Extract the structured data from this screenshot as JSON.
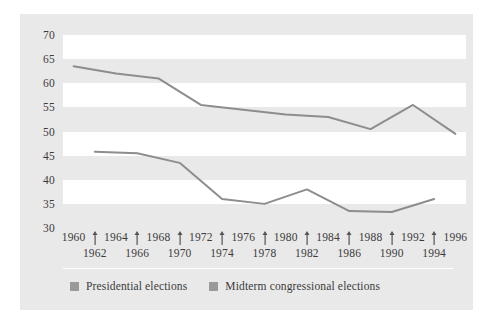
{
  "chart_data": {
    "type": "line",
    "title": "",
    "subtitle": "",
    "xlabel": "",
    "ylabel": "",
    "ylim": [
      30,
      70
    ],
    "ytick_step": 5,
    "ytick_labels": [
      "70",
      "65",
      "60",
      "55",
      "50",
      "45",
      "40",
      "35",
      "30"
    ],
    "grid": "horizontal-bands",
    "legend_position": "bottom-left",
    "xlim": [
      1959,
      1997
    ],
    "line_color": "#8d8d8d",
    "band_color": "#ffffff",
    "panel_color": "#e9e9e9",
    "series": [
      {
        "name": "Presidential elections",
        "x": [
          1960,
          1964,
          1968,
          1972,
          1976,
          1980,
          1984,
          1988,
          1992,
          1996
        ],
        "xlabels": [
          "1960",
          "1964",
          "1968",
          "1972",
          "1976",
          "1980",
          "1984",
          "1988",
          "1992",
          "1996"
        ],
        "values": [
          63.5,
          62.0,
          61.0,
          55.5,
          54.5,
          53.5,
          53.0,
          50.5,
          55.5,
          49.5
        ]
      },
      {
        "name": "Midterm congressional elections",
        "x": [
          1962,
          1966,
          1970,
          1974,
          1978,
          1982,
          1986,
          1990,
          1994
        ],
        "xlabels": [
          "1962",
          "1966",
          "1970",
          "1974",
          "1978",
          "1982",
          "1986",
          "1990",
          "1994"
        ],
        "values": [
          45.8,
          45.5,
          43.5,
          36.0,
          35.0,
          38.0,
          33.5,
          33.3,
          36.0
        ]
      }
    ]
  },
  "legend": {
    "items": [
      {
        "label": "Presidential elections",
        "color": "#9a9a9a"
      },
      {
        "label": "Midterm congressional elections",
        "color": "#9a9a9a"
      }
    ]
  }
}
